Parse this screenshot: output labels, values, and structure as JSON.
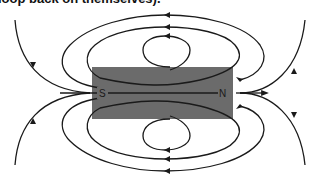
{
  "caption": "loop back on themselves).",
  "diagram": {
    "magnet": {
      "color": "#6b6b6b",
      "south_label": "S",
      "north_label": "N"
    },
    "line_color": "#1a1a1a",
    "field_lines_above": 3,
    "field_lines_below": 3,
    "axial_lines": 4
  }
}
